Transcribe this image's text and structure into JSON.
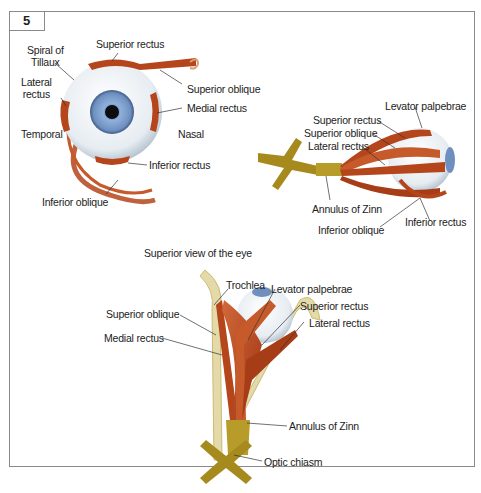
{
  "figure": {
    "number": "5",
    "colors": {
      "muscle": "#b5451b",
      "muscle_light": "#d2693a",
      "nerve": "#a68a1e",
      "iris": "#6f8fbf",
      "sclera": "#eef2f5",
      "bone": "#e4d9a8",
      "frame": "#8a8a8a"
    }
  },
  "anterior_view": {
    "labels": {
      "spiral_of_tillaux_1": "Spiral of",
      "spiral_of_tillaux_2": "Tillaux",
      "superior_rectus": "Superior rectus",
      "lateral_rectus_1": "Lateral",
      "lateral_rectus_2": "rectus",
      "superior_oblique": "Superior oblique",
      "medial_rectus": "Medial rectus",
      "temporal": "Temporal",
      "nasal": "Nasal",
      "inferior_rectus": "Inferior rectus",
      "inferior_oblique": "Inferior oblique"
    }
  },
  "lateral_view": {
    "labels": {
      "levator_palpebrae": "Levator palpebrae",
      "superior_rectus": "Superior rectus",
      "superior_oblique": "Superior oblique",
      "lateral_rectus": "Lateral rectus",
      "annulus_of_zinn": "Annulus of Zinn",
      "inferior_oblique": "Inferior oblique",
      "inferior_rectus": "Inferior rectus"
    }
  },
  "superior_view": {
    "title": "Superior view of the eye",
    "labels": {
      "trochlea": "Trochlea",
      "levator_palpebrae": "Levator palpebrae",
      "superior_oblique": "Superior oblique",
      "superior_rectus": "Superior rectus",
      "medial_rectus": "Medial rectus",
      "lateral_rectus": "Lateral rectus",
      "annulus_of_zinn": "Annulus of Zinn",
      "optic_chiasm": "Optic chiasm"
    }
  }
}
